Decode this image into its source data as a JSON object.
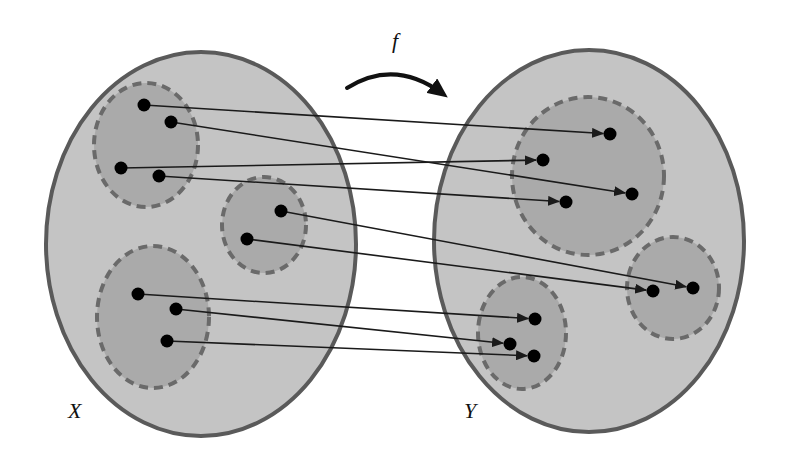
{
  "diagram": {
    "colors": {
      "background": "#ffffff",
      "set_fill": "#c4c4c4",
      "set_stroke": "#5a5a5a",
      "subset_fill": "#aaaaaa",
      "subset_stroke": "#6a6a6a",
      "point": "#000000",
      "arrow": "#1a1a1a"
    },
    "function_label": "f",
    "sets": [
      {
        "id": "X",
        "label": "X",
        "label_pos": [
          68,
          400
        ],
        "shape": {
          "cx": 201,
          "cy": 244,
          "rx": 155,
          "ry": 192
        },
        "subsets": [
          {
            "cx": 146,
            "cy": 145,
            "rx": 52,
            "ry": 62
          },
          {
            "cx": 264,
            "cy": 225,
            "rx": 42,
            "ry": 48
          },
          {
            "cx": 153,
            "cy": 317,
            "rx": 56,
            "ry": 71
          }
        ],
        "points": [
          [
            144,
            105
          ],
          [
            171,
            122
          ],
          [
            121,
            168
          ],
          [
            159,
            176
          ],
          [
            281,
            211
          ],
          [
            247,
            239
          ],
          [
            138,
            294
          ],
          [
            176,
            309
          ],
          [
            167,
            341
          ]
        ]
      },
      {
        "id": "Y",
        "label": "Y",
        "label_pos": [
          464,
          400
        ],
        "shape": {
          "cx": 589,
          "cy": 241,
          "rx": 155,
          "ry": 191
        },
        "subsets": [
          {
            "cx": 588,
            "cy": 176,
            "rx": 76,
            "ry": 79
          },
          {
            "cx": 673,
            "cy": 288,
            "rx": 46,
            "ry": 51
          },
          {
            "cx": 522,
            "cy": 333,
            "rx": 44,
            "ry": 56
          }
        ],
        "points": [
          [
            610,
            134
          ],
          [
            543,
            160
          ],
          [
            632,
            194
          ],
          [
            566,
            202
          ],
          [
            653,
            291
          ],
          [
            693,
            288
          ],
          [
            535,
            319
          ],
          [
            510,
            344
          ],
          [
            534,
            356
          ]
        ]
      }
    ],
    "mappings": [
      {
        "from": [
          144,
          105
        ],
        "to": [
          610,
          134
        ]
      },
      {
        "from": [
          171,
          122
        ],
        "to": [
          632,
          194
        ]
      },
      {
        "from": [
          121,
          168
        ],
        "to": [
          543,
          160
        ]
      },
      {
        "from": [
          159,
          176
        ],
        "to": [
          566,
          202
        ]
      },
      {
        "from": [
          281,
          211
        ],
        "to": [
          693,
          288
        ]
      },
      {
        "from": [
          247,
          239
        ],
        "to": [
          653,
          291
        ]
      },
      {
        "from": [
          138,
          294
        ],
        "to": [
          535,
          319
        ]
      },
      {
        "from": [
          176,
          309
        ],
        "to": [
          510,
          344
        ]
      },
      {
        "from": [
          167,
          341
        ],
        "to": [
          534,
          356
        ]
      }
    ],
    "function_arrow": {
      "start": [
        347,
        88
      ],
      "control": [
        395,
        58
      ],
      "end": [
        443,
        94
      ],
      "label_pos": [
        392,
        30
      ]
    }
  }
}
